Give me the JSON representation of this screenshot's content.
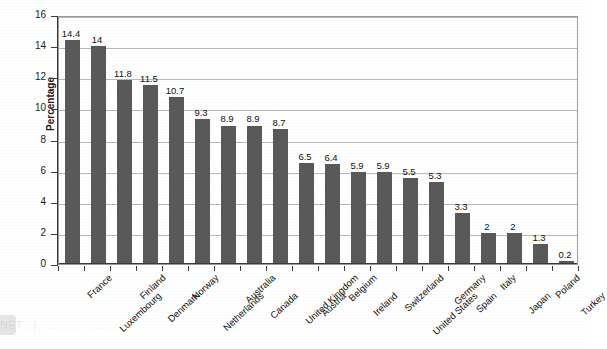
{
  "chart_data": {
    "type": "bar",
    "title": "",
    "xlabel": "",
    "ylabel": "Percentage",
    "ylim": [
      0,
      16
    ],
    "ytick_step": 2,
    "yticks": [
      0,
      2,
      4,
      6,
      8,
      10,
      12,
      14,
      16
    ],
    "grid": true,
    "legend": "none",
    "orientation": "vertical",
    "bar_color": "#59595a",
    "gridline_color": "#b9b9b9",
    "axis_color": "#3a3a3a",
    "categories": [
      "France",
      "Luxembourg",
      "Finland",
      "Denmark",
      "Norway",
      "Netherlands",
      "Australia",
      "Canada",
      "United Kingdom",
      "Austria",
      "Belgium",
      "Ireland",
      "Switzerland",
      "United States",
      "Germany",
      "Spain",
      "Italy",
      "Japan",
      "Poland",
      "Turkey"
    ],
    "values": [
      14.4,
      14,
      11.8,
      11.5,
      10.7,
      9.3,
      8.9,
      8.9,
      8.7,
      6.5,
      6.4,
      5.9,
      5.9,
      5.5,
      5.3,
      3.3,
      2,
      2,
      1.3,
      0.2
    ],
    "value_labels": [
      "14.4",
      "14",
      "11.8",
      "11.5",
      "10.7",
      "9.3",
      "8.9",
      "8.9",
      "8.7",
      "6.5",
      "6.4",
      "5.9",
      "5.9",
      "5.5",
      "5.3",
      "3.3",
      "2",
      "2",
      "1.3",
      "0.2"
    ]
  },
  "artifacts": {
    "bleed_text": "NET ..|.. ....... .. ...... ...."
  }
}
